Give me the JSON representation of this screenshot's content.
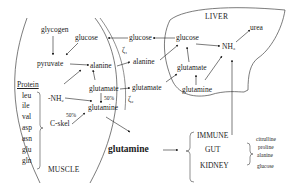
{
  "regions": {
    "muscle": "MUSCLE",
    "liver": "LIVER"
  },
  "muscle": {
    "glycogen": "glycogen",
    "glucose": "glucose",
    "pyruvate": "pyruvate",
    "alanine": "alanine",
    "glutamate": "glutamate",
    "glutamine": "glutamine",
    "nh2": "-NH₂",
    "cskel": "C-skel",
    "pct_glutamate": "50%",
    "pct_cskel": "50%",
    "protein": {
      "title": "Protein",
      "amino_acids": [
        "leu",
        "ile",
        "val",
        "asp",
        "asn",
        "glu",
        "gln"
      ]
    }
  },
  "cycles": {
    "c1": "ζ₁",
    "c2": "ζ₂"
  },
  "blood": {
    "glucose": "glucose",
    "alanine": "alanine",
    "glutamate": "glutamate",
    "glutamine": "glutamine"
  },
  "liver": {
    "glucose": "glucose",
    "nh3": "NH₃",
    "urea": "urea",
    "glutamate": "glutamate",
    "glutamine": "glutamine"
  },
  "targets": {
    "organs": [
      "IMMUNE",
      "GUT",
      "KIDNEY"
    ],
    "gut_products": [
      "citrulline",
      "proline",
      "alanine"
    ],
    "kidney_product": "glucose"
  }
}
